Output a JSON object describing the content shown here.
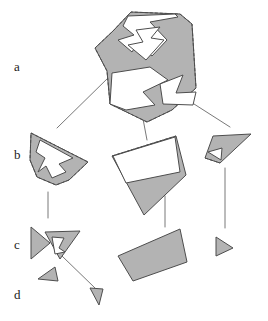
{
  "figure": {
    "type": "diagram",
    "width": 268,
    "height": 321,
    "background": "#ffffff",
    "style": {
      "fill_gray": "#b3b3b3",
      "fill_white": "#ffffff",
      "stroke": "#4d4d4d",
      "stroke_width": 1.0,
      "dash_pattern": "3,2",
      "connector_color": "#555555",
      "connector_width": 0.8
    },
    "row_labels": [
      {
        "id": "a",
        "text": "a",
        "x": 14,
        "y": 60
      },
      {
        "id": "b",
        "text": "b",
        "x": 14,
        "y": 148
      },
      {
        "id": "c",
        "text": "c",
        "x": 14,
        "y": 238
      },
      {
        "id": "d",
        "text": "d",
        "x": 14,
        "y": 288
      }
    ],
    "levels": [
      {
        "id": "a",
        "description": "Original non-convex polygon with its convex hull shown dashed",
        "shapes": [
          {
            "name": "level-a-main-polygon",
            "fill": "#b3b3b3",
            "points": "113,31 131,12 180,14 192,24 196,88 172,110 147,122 110,104 107,71 95,48"
          },
          {
            "name": "level-a-hull-dashed",
            "fill": "none",
            "dashed": true,
            "points": "113,31 131,12 180,14 192,24 196,88 172,110 147,122 110,104 107,71 95,48"
          },
          {
            "name": "level-a-notch-upper-white",
            "fill": "#ffffff",
            "points": "128,16 175,14 178,17 150,22 167,40 152,56 137,44 132,52 118,40 134,35 123,26"
          },
          {
            "name": "level-a-notch-zigzag-white",
            "fill": "#ffffff",
            "points": "136,30 160,27 151,38 164,40 146,60 128,45 143,42"
          },
          {
            "name": "level-a-lower-white-pocket",
            "fill": "#ffffff",
            "points": "110,104 112,73 150,67 168,80 143,92 155,105 126,110"
          },
          {
            "name": "level-a-right-notch-white",
            "fill": "#ffffff",
            "points": "160,84 183,75 176,93 196,92 193,105 163,104"
          }
        ]
      },
      {
        "id": "b",
        "description": "Three sub-pieces extracted at the first decomposition step",
        "shapes": [
          {
            "name": "level-b-left-arrow-piece",
            "fill": "#b3b3b3",
            "points": "31,133 88,162 69,180 56,185 37,177 30,160"
          },
          {
            "name": "level-b-left-hull-dashed",
            "fill": "none",
            "dashed": true,
            "points": "31,133 88,162 69,180 56,185 37,177 30,160"
          },
          {
            "name": "level-b-left-notch-white",
            "fill": "#ffffff",
            "points": "40,140 73,158 59,164 66,172 52,178 46,166 38,172 45,158 36,152"
          },
          {
            "name": "level-b-middle-quad-piece",
            "fill": "#b3b3b3",
            "points": "112,156 176,136 186,175 144,215"
          },
          {
            "name": "level-b-middle-white-region",
            "fill": "#ffffff",
            "points": "113,156 175,137 180,172 126,183"
          },
          {
            "name": "level-b-middle-dashed-edge",
            "fill": "none",
            "dashed": true,
            "points": "112,156 176,136"
          },
          {
            "name": "level-b-right-triangle-piece",
            "fill": "#b3b3b3",
            "points": "213,136 251,134 220,163 205,158"
          },
          {
            "name": "level-b-right-notch-white",
            "fill": "#ffffff",
            "points": "208,152 222,148 221,160"
          },
          {
            "name": "level-b-right-dashed-edge",
            "fill": "none",
            "dashed": true,
            "points": "205,158 220,163"
          }
        ]
      },
      {
        "id": "c",
        "description": "Convex leaf pieces after the second decomposition step",
        "shapes": [
          {
            "name": "level-c-left-triangle",
            "fill": "#b3b3b3",
            "points": "31,227 50,243 31,259"
          },
          {
            "name": "level-c-left-inner-triangle",
            "fill": "#b3b3b3",
            "points": "45,232 80,231 60,259"
          },
          {
            "name": "level-c-left-inner-notch-white",
            "fill": "#ffffff",
            "points": "52,237 64,238 59,248 65,252 55,254"
          },
          {
            "name": "level-c-left-small-triangle",
            "fill": "#b3b3b3",
            "points": "38,279 55,267 58,281"
          },
          {
            "name": "level-c-middle-quad",
            "fill": "#b3b3b3",
            "points": "118,256 180,229 187,262 133,281"
          },
          {
            "name": "level-c-right-triangle",
            "fill": "#b3b3b3",
            "points": "216,237 233,248 216,256"
          }
        ]
      },
      {
        "id": "d",
        "description": "Final residual sliver piece",
        "shapes": [
          {
            "name": "level-d-sliver-triangle",
            "fill": "#b3b3b3",
            "points": "90,288 103,289 99,305"
          }
        ]
      }
    ],
    "connectors": [
      {
        "name": "connector-a-to-b-left",
        "x1": 109,
        "y1": 77,
        "x2": 57,
        "y2": 128
      },
      {
        "name": "connector-a-to-b-middle",
        "x1": 137,
        "y1": 87,
        "x2": 147,
        "y2": 140
      },
      {
        "name": "connector-a-to-b-right",
        "x1": 169,
        "y1": 88,
        "x2": 230,
        "y2": 127
      },
      {
        "name": "connector-b-to-c-left",
        "x1": 48,
        "y1": 192,
        "x2": 48,
        "y2": 218
      },
      {
        "name": "connector-b-to-c-middle",
        "x1": 165,
        "y1": 196,
        "x2": 165,
        "y2": 227
      },
      {
        "name": "connector-b-to-c-right",
        "x1": 225,
        "y1": 168,
        "x2": 225,
        "y2": 228
      },
      {
        "name": "connector-c-to-d",
        "x1": 62,
        "y1": 256,
        "x2": 95,
        "y2": 288
      }
    ]
  }
}
